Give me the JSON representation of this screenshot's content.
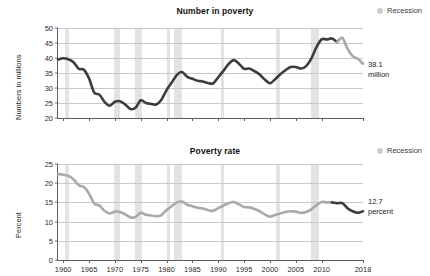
{
  "legend": {
    "label": "Recession",
    "swatch_color": "#e3e3e3",
    "icon": "recession-dot-icon"
  },
  "colors": {
    "line_dark": "#3c3c3c",
    "line_light": "#a9a9a9",
    "recession_band": "#e3e3e3",
    "gridline": "#c9c9c9",
    "axis": "#5d5d5d",
    "text": "#1a1a1a"
  },
  "panels": [
    {
      "id": "number-in-poverty",
      "title": "Number in poverty",
      "ylabel": "Numbers in millions",
      "annotation": "38.1\nmillion",
      "annotation_value": 38.1,
      "annotation_unit": "million"
    },
    {
      "id": "poverty-rate",
      "title": "Poverty rate",
      "ylabel": "Percent",
      "annotation": "12.7\npercent",
      "annotation_value": 12.7,
      "annotation_unit": "percent"
    }
  ],
  "chart_data": [
    {
      "type": "line",
      "title": "Number in poverty",
      "xlabel": "",
      "ylabel": "Numbers in millions",
      "xlim": [
        1959,
        2018
      ],
      "ylim": [
        20,
        50
      ],
      "yticks": [
        20,
        25,
        30,
        35,
        40,
        45,
        50
      ],
      "xticks": [
        1960,
        1965,
        1970,
        1975,
        1980,
        1985,
        1990,
        1995,
        2000,
        2005,
        2010,
        2018
      ],
      "grid": true,
      "legend_position": "top-right",
      "annotations": [
        {
          "text": "38.1 million",
          "x": 2018,
          "y": 38.1
        }
      ],
      "recessions": [
        [
          1960.3,
          1961.1
        ],
        [
          1969.9,
          1970.9
        ],
        [
          1973.9,
          1975.2
        ],
        [
          1980.1,
          1980.6
        ],
        [
          1981.5,
          1982.9
        ],
        [
          1990.6,
          1991.2
        ],
        [
          2001.2,
          2001.9
        ],
        [
          2007.9,
          2009.5
        ]
      ],
      "series": [
        {
          "name": "Number in poverty (official)",
          "color": "#3c3c3c",
          "x": [
            1959,
            1960,
            1961,
            1962,
            1963,
            1964,
            1965,
            1966,
            1967,
            1968,
            1969,
            1970,
            1971,
            1972,
            1973,
            1974,
            1975,
            1976,
            1977,
            1978,
            1979,
            1980,
            1981,
            1982,
            1983,
            1984,
            1985,
            1986,
            1987,
            1988,
            1989,
            1990,
            1991,
            1992,
            1993,
            1994,
            1995,
            1996,
            1997,
            1998,
            1999,
            2000,
            2001,
            2002,
            2003,
            2004,
            2005,
            2006,
            2007,
            2008,
            2009,
            2010,
            2011,
            2012,
            2013
          ],
          "values": [
            39.5,
            39.9,
            39.6,
            38.6,
            36.4,
            36.1,
            33.2,
            28.5,
            27.8,
            25.4,
            24.1,
            25.4,
            25.6,
            24.5,
            23.0,
            23.4,
            25.9,
            25.0,
            24.7,
            24.5,
            26.1,
            29.3,
            31.8,
            34.4,
            35.3,
            33.7,
            33.1,
            32.4,
            32.2,
            31.7,
            31.5,
            33.6,
            35.7,
            38.0,
            39.3,
            38.1,
            36.4,
            36.5,
            35.6,
            34.5,
            32.8,
            31.6,
            32.9,
            34.6,
            35.9,
            37.0,
            37.0,
            36.5,
            37.3,
            39.8,
            43.6,
            46.2,
            46.2,
            46.5,
            45.3
          ]
        },
        {
          "name": "Number in poverty (SPM / later years)",
          "color": "#a9a9a9",
          "x": [
            2013,
            2014,
            2015,
            2016,
            2017,
            2018
          ],
          "values": [
            45.3,
            46.7,
            43.1,
            40.6,
            39.7,
            38.1
          ]
        }
      ]
    },
    {
      "type": "line",
      "title": "Poverty rate",
      "xlabel": "",
      "ylabel": "Percent",
      "xlim": [
        1959,
        2018
      ],
      "ylim": [
        0,
        25
      ],
      "yticks": [
        0,
        5,
        10,
        15,
        20,
        25
      ],
      "xticks": [
        1960,
        1965,
        1970,
        1975,
        1980,
        1985,
        1990,
        1995,
        2000,
        2005,
        2010,
        2018
      ],
      "grid": true,
      "legend_position": "top-right",
      "annotations": [
        {
          "text": "12.7 percent",
          "x": 2018,
          "y": 12.7
        }
      ],
      "recessions": [
        [
          1960.3,
          1961.1
        ],
        [
          1969.9,
          1970.9
        ],
        [
          1973.9,
          1975.2
        ],
        [
          1980.1,
          1980.6
        ],
        [
          1981.5,
          1982.9
        ],
        [
          1990.6,
          1991.2
        ],
        [
          2001.2,
          2001.9
        ],
        [
          2007.9,
          2009.5
        ]
      ],
      "series": [
        {
          "name": "Poverty rate (official)",
          "color": "#a9a9a9",
          "x": [
            1959,
            1960,
            1961,
            1962,
            1963,
            1964,
            1965,
            1966,
            1967,
            1968,
            1969,
            1970,
            1971,
            1972,
            1973,
            1974,
            1975,
            1976,
            1977,
            1978,
            1979,
            1980,
            1981,
            1982,
            1983,
            1984,
            1985,
            1986,
            1987,
            1988,
            1989,
            1990,
            1991,
            1992,
            1993,
            1994,
            1995,
            1996,
            1997,
            1998,
            1999,
            2000,
            2001,
            2002,
            2003,
            2004,
            2005,
            2006,
            2007,
            2008,
            2009,
            2010,
            2011,
            2012
          ],
          "values": [
            22.4,
            22.2,
            21.9,
            21.0,
            19.5,
            19.0,
            17.3,
            14.7,
            14.2,
            12.8,
            12.1,
            12.6,
            12.5,
            11.9,
            11.1,
            11.2,
            12.3,
            11.8,
            11.6,
            11.4,
            11.7,
            13.0,
            14.0,
            15.0,
            15.2,
            14.4,
            14.0,
            13.6,
            13.4,
            13.0,
            12.8,
            13.5,
            14.2,
            14.8,
            15.1,
            14.5,
            13.8,
            13.7,
            13.3,
            12.7,
            11.9,
            11.3,
            11.7,
            12.1,
            12.5,
            12.7,
            12.6,
            12.3,
            12.5,
            13.2,
            14.3,
            15.1,
            15.0,
            15.0
          ]
        },
        {
          "name": "Poverty rate (later years)",
          "color": "#3c3c3c",
          "x": [
            2012,
            2013,
            2014,
            2015,
            2016,
            2017,
            2018
          ],
          "values": [
            15.0,
            14.8,
            14.8,
            13.5,
            12.7,
            12.3,
            12.7
          ]
        }
      ]
    }
  ]
}
